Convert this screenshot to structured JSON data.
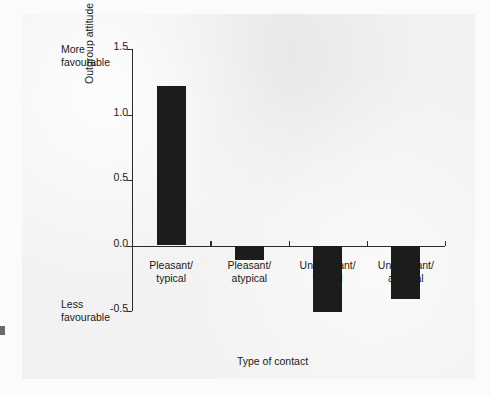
{
  "chart_data": {
    "type": "bar",
    "title": "",
    "subtitle": "",
    "categories": [
      "Pleasant/\ntypical",
      "Pleasant/\natypical",
      "Unpleasant/\ntypical",
      "Unpleasant/\natypical"
    ],
    "category_lines": [
      [
        "Pleasant/",
        "typical"
      ],
      [
        "Pleasant/",
        "atypical"
      ],
      [
        "Unpleasant/",
        "typical"
      ],
      [
        "Unpleasant/",
        "atypical"
      ]
    ],
    "values": [
      1.22,
      -0.11,
      -0.51,
      -0.41
    ],
    "xlabel": "Type of contact",
    "ylabel": "Outgroup attitude relative to no contact",
    "ylim": [
      -0.5,
      1.5
    ],
    "yticks": [
      1.5,
      1.0,
      0.5,
      0.0,
      -0.5
    ],
    "ytick_labels": [
      "1.5",
      "1.0",
      "0.5",
      "0.0",
      "-0.5"
    ],
    "grid": false,
    "legend": null,
    "bar_color": "#1c1c1c",
    "axis_color": "#2b2b2b",
    "annotations": {
      "top_left": [
        "More",
        "favourable"
      ],
      "bottom_left": [
        "Less",
        "favourable"
      ]
    }
  },
  "annotations": {
    "more_favourable_line1": "More",
    "more_favourable_line2": "favourable",
    "less_favourable_line1": "Less",
    "less_favourable_line2": "favourable"
  }
}
